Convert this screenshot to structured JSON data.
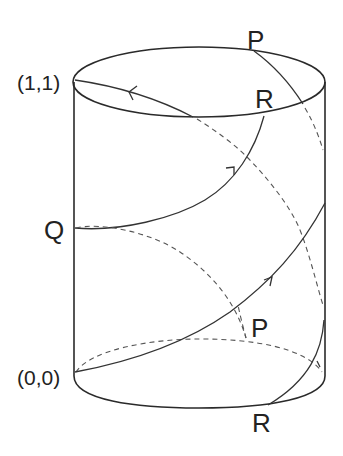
{
  "figure": {
    "type": "cylinder-identification-diagram",
    "labels": {
      "top_p": "P",
      "top_r": "R",
      "q": "Q",
      "coord_top": "(1,1)",
      "coord_bottom": "(0,0)",
      "bottom_p": "P",
      "bottom_r": "R"
    },
    "paths": [
      {
        "name": "path-q-to-r",
        "from": "Q",
        "to": "R",
        "style": "solid",
        "arrow": "forward"
      },
      {
        "name": "path-origin-to-right",
        "from": "(0,0)",
        "to": "right-edge",
        "style": "solid",
        "arrow": "forward"
      },
      {
        "name": "path-top-rim-to-11",
        "from": "top-rim",
        "to": "(1,1)",
        "style": "solid",
        "arrow": "forward"
      },
      {
        "name": "path-p-to-r-right",
        "from": "P",
        "to": "R",
        "style": "solid/dashed",
        "arrow": "none"
      },
      {
        "name": "path-hidden-q",
        "from": "Q",
        "to": "P",
        "style": "dashed",
        "arrow": "none"
      }
    ],
    "colors": {
      "stroke": "#2a2a2a",
      "hidden": "#555555",
      "background": "#ffffff"
    }
  }
}
